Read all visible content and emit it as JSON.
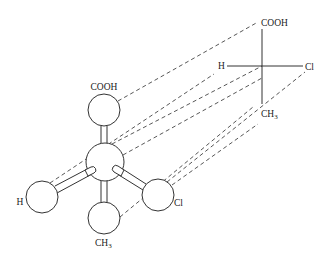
{
  "diagram": {
    "ball_model": {
      "center_atom": "C",
      "top": {
        "label": "COOH"
      },
      "left": {
        "label": "H"
      },
      "right": {
        "label": "Cl"
      },
      "bottom": {
        "label": "CH",
        "subscript": "3"
      }
    },
    "fischer_projection": {
      "top": {
        "label": "COOH"
      },
      "left": {
        "label": "H"
      },
      "right": {
        "label": "Cl"
      },
      "bottom": {
        "label": "CH",
        "subscript": "3"
      }
    },
    "colors": {
      "line": "#333333",
      "background": "#ffffff"
    }
  }
}
